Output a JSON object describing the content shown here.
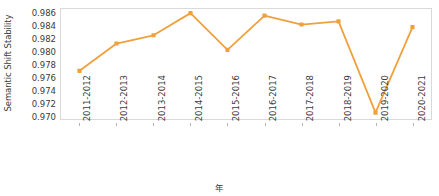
{
  "chart_data": {
    "type": "line",
    "title": "",
    "xlabel": "年",
    "ylabel": "Semantic Shift Stability",
    "categories": [
      "2011-2012",
      "2012-2013",
      "2013-2014",
      "2014-2015",
      "2015-2016",
      "2016-2017",
      "2017-2018",
      "2018-2019",
      "2019-2020",
      "2020-2021"
    ],
    "values": [
      0.9771,
      0.9814,
      0.9827,
      0.9862,
      0.9804,
      0.9858,
      0.9844,
      0.9849,
      0.9705,
      0.984
    ],
    "series": [
      {
        "name": "Semantic Shift Stability",
        "values": [
          0.9771,
          0.9814,
          0.9827,
          0.9862,
          0.9804,
          0.9858,
          0.9844,
          0.9849,
          0.9705,
          0.984
        ]
      }
    ],
    "ylim": [
      0.9695,
      0.98685
    ],
    "yticks": [
      0.97,
      0.972,
      0.974,
      0.976,
      0.978,
      0.98,
      0.982,
      0.984,
      0.986
    ],
    "ytick_labels": [
      "0.970",
      "0.972",
      "0.974",
      "0.976",
      "0.978",
      "0.980",
      "0.982",
      "0.984",
      "0.986"
    ],
    "grid": false,
    "legend": "none",
    "line_color": "#f0a13c",
    "marker_color": "#f0a13c",
    "marker": "square",
    "axis_color": "#d9d9d9",
    "text_color": "#3b3b3b",
    "background": "#ffffff"
  }
}
